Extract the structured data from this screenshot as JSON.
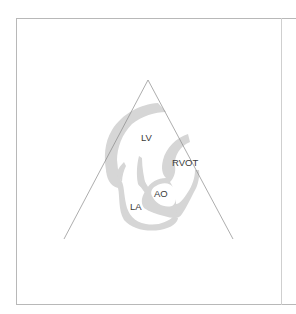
{
  "figure": {
    "type": "echocardiography-view-schematic",
    "labels": {
      "lv": "LV",
      "rvot": "RVOT",
      "ao": "AO",
      "la": "LA"
    },
    "colors": {
      "wall": "#d6d6d6",
      "sector_line": "#8a8a8a",
      "frame": "#b8b8b8",
      "text": "#3a3a3a"
    }
  }
}
